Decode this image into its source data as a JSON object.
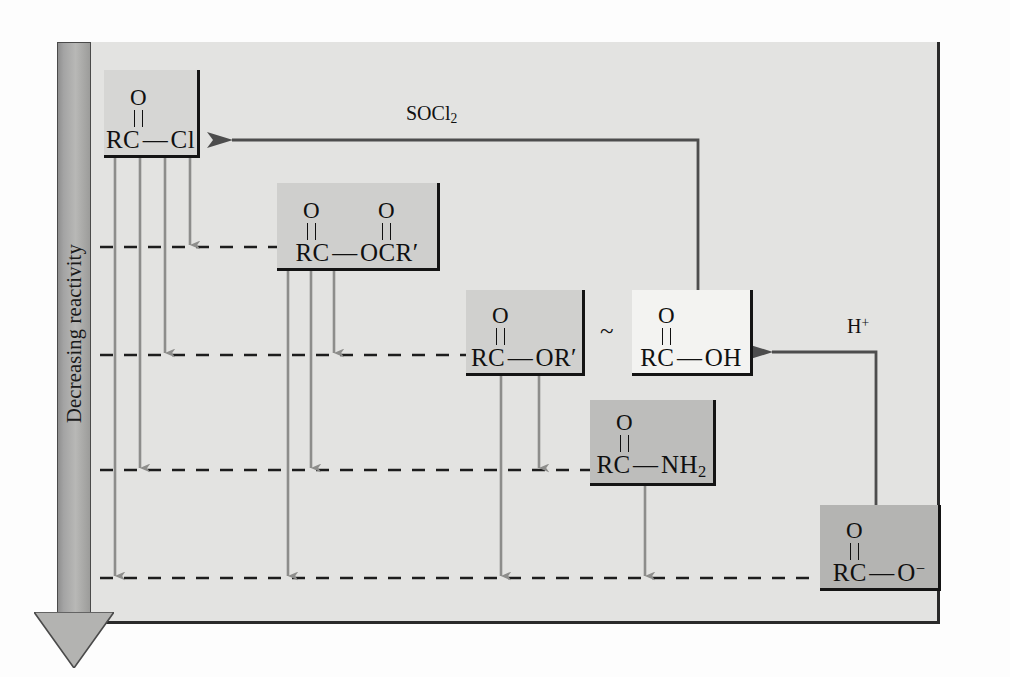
{
  "axis": {
    "label": "Decreasing reactivity",
    "direction": "down"
  },
  "panel": {
    "background_color": "#e3e3e1",
    "border_color": "#2a2a2a"
  },
  "species": [
    {
      "id": "acid-chloride",
      "name": "acyl chloride",
      "carbonyl_oxygens": [
        "O"
      ],
      "formula_prefix": "RC",
      "bond": "—",
      "leaving_group": "Cl",
      "formula": "RC — Cl",
      "fill_color": "#d6d6d4",
      "rank": 1
    },
    {
      "id": "anhydride",
      "name": "acid anhydride",
      "carbonyl_oxygens": [
        "O",
        "O"
      ],
      "formula_prefix": "RC",
      "bond": "—",
      "leaving_group": "OCR′",
      "formula": "RC — OCR′",
      "fill_color": "#cfcfcd",
      "rank": 2
    },
    {
      "id": "ester",
      "name": "ester",
      "carbonyl_oxygens": [
        "O"
      ],
      "formula_prefix": "RC",
      "bond": "—",
      "leaving_group": "OR′",
      "formula": "RC — OR′",
      "fill_color": "#d0d0ce",
      "rank": 3
    },
    {
      "id": "carboxylic-acid",
      "name": "carboxylic acid",
      "carbonyl_oxygens": [
        "O"
      ],
      "formula_prefix": "RC",
      "bond": "—",
      "leaving_group": "OH",
      "formula": "RC — OH",
      "fill_color": "#f3f3f1",
      "rank": 3
    },
    {
      "id": "amide",
      "name": "amide",
      "carbonyl_oxygens": [
        "O"
      ],
      "formula_prefix": "RC",
      "bond": "—",
      "leaving_group": "NH2",
      "formula": "RC — NH₂",
      "fill_color": "#bdbdbb",
      "rank": 4
    },
    {
      "id": "carboxylate",
      "name": "carboxylate ion",
      "carbonyl_oxygens": [
        "O"
      ],
      "formula_prefix": "RC",
      "bond": "—",
      "leaving_group": "O-",
      "formula": "RC — O⁻",
      "fill_color": "#b4b4b2",
      "rank": 5
    }
  ],
  "equivalence": {
    "symbol": "~",
    "between": [
      "ester",
      "carboxylic-acid"
    ]
  },
  "reagents": [
    {
      "id": "socl2",
      "label": "SOCl2",
      "from": "carboxylic-acid",
      "to": "acid-chloride"
    },
    {
      "id": "hplus",
      "label": "H+",
      "from": "carboxylate",
      "to": "carboxylic-acid"
    }
  ],
  "conversion_arrows": [
    {
      "from": "acid-chloride",
      "to": "anhydride"
    },
    {
      "from": "acid-chloride",
      "to": "ester"
    },
    {
      "from": "acid-chloride",
      "to": "amide"
    },
    {
      "from": "acid-chloride",
      "to": "carboxylate"
    },
    {
      "from": "anhydride",
      "to": "ester"
    },
    {
      "from": "anhydride",
      "to": "amide"
    },
    {
      "from": "anhydride",
      "to": "carboxylate"
    },
    {
      "from": "ester",
      "to": "amide"
    },
    {
      "from": "ester",
      "to": "carboxylate"
    },
    {
      "from": "amide",
      "to": "carboxylate"
    }
  ],
  "levels": [
    {
      "index": 1,
      "species": "anhydride"
    },
    {
      "index": 2,
      "species": "ester"
    },
    {
      "index": 3,
      "species": "amide"
    },
    {
      "index": 4,
      "species": "carboxylate"
    }
  ]
}
